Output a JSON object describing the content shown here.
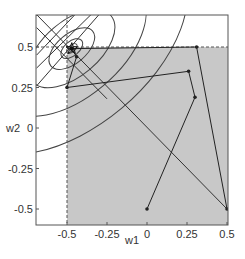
{
  "chart_data": {
    "type": "line",
    "title": "",
    "xlabel": "w1",
    "ylabel": "w2",
    "xlim": [
      -0.69,
      0.51
    ],
    "ylim": [
      -0.6,
      0.7
    ],
    "xticks": [
      -0.5,
      -0.25,
      0,
      0.25,
      0.5
    ],
    "yticks": [
      -0.5,
      -0.25,
      0,
      0.25,
      0.5
    ],
    "xtick_labels": [
      "-0.5",
      "-0.25",
      "0",
      "0.25",
      "0.5"
    ],
    "ytick_labels": [
      "-0.5",
      "-0.25",
      "0",
      "0.25",
      "0.5"
    ],
    "grid": false,
    "feasible_region": {
      "description": "shaded region w1 >= -0.5 and w2 <= 0.5",
      "w1_min": -0.5,
      "w2_max": 0.5,
      "color": "#c8c8c8"
    },
    "constraint_lines": [
      {
        "type": "vertical",
        "w1": -0.5,
        "style": "dashed"
      },
      {
        "type": "horizontal",
        "w2": 0.5,
        "style": "dashed"
      }
    ],
    "contours": {
      "type": "ellipse",
      "center": [
        -0.47,
        0.49
      ],
      "orientation_deg": -40,
      "semi_axes": [
        [
          0.04,
          0.02
        ],
        [
          0.08,
          0.045
        ],
        [
          0.17,
          0.09
        ],
        [
          0.32,
          0.17
        ],
        [
          0.55,
          0.3
        ],
        [
          0.85,
          0.48
        ]
      ]
    },
    "diagonal_lines": [
      {
        "from": [
          -0.69,
          0.7
        ],
        "to": [
          0.5,
          -0.5
        ]
      },
      {
        "from": [
          -0.69,
          0.45
        ],
        "to": [
          -0.45,
          0.7
        ]
      },
      {
        "from": [
          -0.69,
          0.37
        ],
        "to": [
          -0.35,
          0.7
        ]
      }
    ],
    "series": [
      {
        "name": "optimization path",
        "points": [
          [
            0.0,
            -0.5
          ],
          [
            0.3,
            0.19
          ],
          [
            0.26,
            0.35
          ],
          [
            -0.5,
            0.25
          ],
          [
            -0.44,
            0.44
          ],
          [
            -0.47,
            0.49
          ]
        ],
        "color": "#222222",
        "marker": "dot"
      },
      {
        "name": "optimization path 2",
        "points": [
          [
            0.5,
            -0.5
          ],
          [
            0.31,
            0.5
          ],
          [
            -0.47,
            0.49
          ]
        ],
        "color": "#222222",
        "marker": "dot"
      }
    ],
    "optimum": {
      "w1": -0.47,
      "w2": 0.49,
      "marker": "star"
    }
  }
}
